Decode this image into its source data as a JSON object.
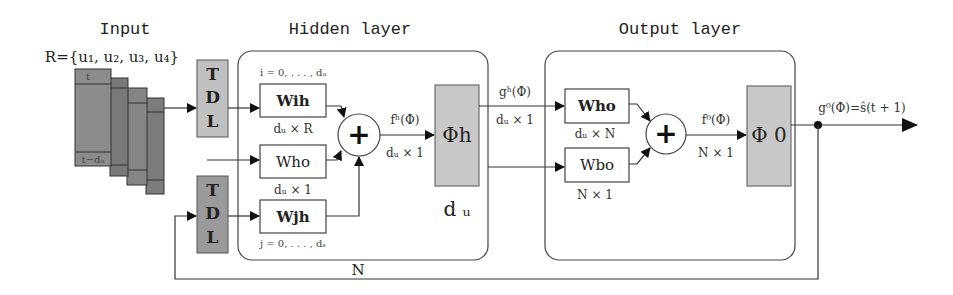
{
  "titles": {
    "input": "Input",
    "hidden": "Hidden layer",
    "output": "Output layer"
  },
  "input": {
    "set_label": "R={u₁, u₂, u₃, u₄}",
    "frame_top": "t",
    "frame_bottom": "t−dᵤ"
  },
  "tdl": {
    "top": [
      "T",
      "D",
      "L"
    ],
    "bottom": [
      "T",
      "D",
      "L"
    ]
  },
  "hidden": {
    "wih": {
      "label": "Wih",
      "range": "i = 0, . . . , dᵤ",
      "dim": "dᵤ × R"
    },
    "who": {
      "label": "Who",
      "dim": "dᵤ × 1"
    },
    "wjh": {
      "label": "Wjh",
      "range": "j = 0, . . . , dₛ"
    },
    "sum_symbol": "+",
    "f_label": "fʰ(Φ)",
    "f_dim": "dᵤ × 1",
    "phi_label": "Φh",
    "phi_size": "d ᵤ"
  },
  "between": {
    "g_label": "gʰ(Φ)",
    "g_dim": "dᵤ × 1"
  },
  "output": {
    "who": {
      "label": "Who",
      "dim": "dᵤ × N"
    },
    "wbo": {
      "label": "Wbo",
      "dim": "N × 1"
    },
    "sum_symbol": "+",
    "f_label": "f⁰(Φ)",
    "f_dim": "N × 1",
    "phi_label": "Φ 0",
    "g_label": "g⁰(Φ)=ŝ(t + 1)"
  },
  "feedback": {
    "label": "N"
  },
  "colors": {
    "block_fill": "#c8c8c8",
    "input_stack": [
      "#8c8c8c",
      "#7a7a7a",
      "#858585",
      "#7c7c7c"
    ],
    "line": "#333333"
  }
}
